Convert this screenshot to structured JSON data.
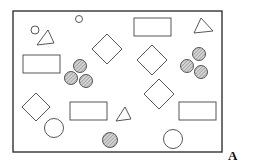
{
  "figure": {
    "panel_label": "A",
    "colors": {
      "stroke": "#444444",
      "hatch_fill": "#bfbfbf",
      "background": "#ffffff"
    },
    "frame": {
      "x": 13,
      "y": 11,
      "w": 209,
      "h": 141
    },
    "shapes": [
      {
        "type": "circle",
        "cx": 35,
        "cy": 30,
        "r": 4,
        "filled": false
      },
      {
        "type": "circle",
        "cx": 79,
        "cy": 19,
        "r": 3.5,
        "filled": false
      },
      {
        "type": "triangle",
        "points": "37,45 48,30 54,43"
      },
      {
        "type": "triangle",
        "points": "194,33 201,18 213,31"
      },
      {
        "type": "rect",
        "x": 23,
        "y": 55,
        "w": 37,
        "h": 18
      },
      {
        "type": "rect",
        "x": 134,
        "y": 18,
        "w": 37,
        "h": 18
      },
      {
        "type": "rect",
        "x": 70,
        "y": 102,
        "w": 37,
        "h": 18
      },
      {
        "type": "rect",
        "x": 179,
        "y": 102,
        "w": 37,
        "h": 18
      },
      {
        "type": "diamond",
        "cx": 107,
        "cy": 49,
        "s": 15
      },
      {
        "type": "diamond",
        "cx": 152,
        "cy": 60,
        "s": 15
      },
      {
        "type": "diamond",
        "cx": 36,
        "cy": 107,
        "s": 14
      },
      {
        "type": "diamond",
        "cx": 159,
        "cy": 94,
        "s": 15
      },
      {
        "type": "circle",
        "cx": 80,
        "cy": 66,
        "r": 6.5,
        "filled": true
      },
      {
        "type": "circle",
        "cx": 71,
        "cy": 78,
        "r": 6.5,
        "filled": true
      },
      {
        "type": "circle",
        "cx": 86,
        "cy": 81,
        "r": 6.5,
        "filled": true
      },
      {
        "type": "circle",
        "cx": 199,
        "cy": 54,
        "r": 6.5,
        "filled": true
      },
      {
        "type": "circle",
        "cx": 187,
        "cy": 66,
        "r": 6.5,
        "filled": true
      },
      {
        "type": "circle",
        "cx": 201,
        "cy": 72,
        "r": 6.5,
        "filled": true
      },
      {
        "type": "triangle",
        "points": "116,121 125,107 131,119"
      },
      {
        "type": "circle",
        "cx": 54,
        "cy": 128,
        "r": 9.5,
        "filled": false
      },
      {
        "type": "circle",
        "cx": 173,
        "cy": 139,
        "r": 9.5,
        "filled": false
      },
      {
        "type": "circle",
        "cx": 110,
        "cy": 140,
        "r": 7.5,
        "filled": true
      }
    ]
  }
}
